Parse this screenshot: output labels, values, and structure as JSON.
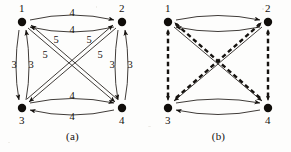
{
  "figure": {
    "background_color": "#fdfdfc",
    "ink_color": "#15120f",
    "node_labels": [
      "1",
      "2",
      "3",
      "4"
    ],
    "panels": [
      {
        "id": "a",
        "caption": "(a)",
        "description": "complete directed graph on 4 nodes with weighted bidirectional arcs",
        "nodes": [
          {
            "id": "1",
            "label": "1",
            "x": 22,
            "y": 22,
            "label_pos": "above"
          },
          {
            "id": "2",
            "label": "2",
            "x": 122,
            "y": 22,
            "label_pos": "above"
          },
          {
            "id": "3",
            "label": "3",
            "x": 22,
            "y": 108,
            "label_pos": "below"
          },
          {
            "id": "4",
            "label": "4",
            "x": 122,
            "y": 108,
            "label_pos": "below"
          }
        ],
        "edges": [
          {
            "from": "1",
            "to": "2",
            "style": "solid",
            "arrows": "both",
            "kind": "top",
            "labels": [
              "4",
              "4"
            ]
          },
          {
            "from": "3",
            "to": "4",
            "style": "solid",
            "arrows": "both",
            "kind": "bottom",
            "labels": [
              "4",
              "4"
            ]
          },
          {
            "from": "1",
            "to": "3",
            "style": "solid",
            "arrows": "both",
            "kind": "left",
            "labels": [
              "3",
              "3"
            ]
          },
          {
            "from": "2",
            "to": "4",
            "style": "solid",
            "arrows": "both",
            "kind": "right",
            "labels": [
              "3",
              "3"
            ]
          },
          {
            "from": "1",
            "to": "4",
            "style": "solid",
            "arrows": "both",
            "kind": "diagonal",
            "labels": [
              "5",
              "5"
            ]
          },
          {
            "from": "2",
            "to": "3",
            "style": "solid",
            "arrows": "both",
            "kind": "diagonal",
            "labels": [
              "5",
              "5"
            ]
          }
        ],
        "weight_labels": [
          {
            "text": "4",
            "x": 72,
            "y": 16
          },
          {
            "text": "4",
            "x": 72,
            "y": 33
          },
          {
            "text": "3",
            "x": 14,
            "y": 68
          },
          {
            "text": "3",
            "x": 30,
            "y": 68
          },
          {
            "text": "3",
            "x": 113,
            "y": 68
          },
          {
            "text": "3",
            "x": 130,
            "y": 68
          },
          {
            "text": "5",
            "x": 56,
            "y": 41
          },
          {
            "text": "5",
            "x": 46,
            "y": 56
          },
          {
            "text": "5",
            "x": 88,
            "y": 41
          },
          {
            "text": "5",
            "x": 99,
            "y": 56
          },
          {
            "text": "4",
            "x": 72,
            "y": 98
          },
          {
            "text": "4",
            "x": 72,
            "y": 119
          }
        ]
      },
      {
        "id": "b",
        "caption": "(b)",
        "description": "same 4-node graph with dashed edges marking a selected subgraph; no weight labels",
        "nodes": [
          {
            "id": "1",
            "label": "1",
            "x": 22,
            "y": 22,
            "label_pos": "above"
          },
          {
            "id": "2",
            "label": "2",
            "x": 122,
            "y": 22,
            "label_pos": "above"
          },
          {
            "id": "3",
            "label": "3",
            "x": 22,
            "y": 108,
            "label_pos": "below"
          },
          {
            "id": "4",
            "label": "4",
            "x": 122,
            "y": 108,
            "label_pos": "below"
          }
        ],
        "edges": [
          {
            "from": "1",
            "to": "2",
            "style": "solid",
            "arrows": "both",
            "kind": "top",
            "labels": []
          },
          {
            "from": "3",
            "to": "4",
            "style": "solid",
            "arrows": "both",
            "kind": "bottom",
            "labels": []
          },
          {
            "from": "1",
            "to": "3",
            "style": "dashed",
            "arrows": "both",
            "kind": "left",
            "labels": []
          },
          {
            "from": "2",
            "to": "4",
            "style": "dashed",
            "arrows": "both",
            "kind": "right",
            "labels": []
          },
          {
            "from": "1",
            "to": "4",
            "style": "solid+dashed",
            "arrows": "both",
            "kind": "diagonal",
            "labels": []
          },
          {
            "from": "2",
            "to": "3",
            "style": "solid+dashed",
            "arrows": "both",
            "kind": "diagonal",
            "labels": []
          }
        ],
        "weight_labels": []
      }
    ]
  }
}
